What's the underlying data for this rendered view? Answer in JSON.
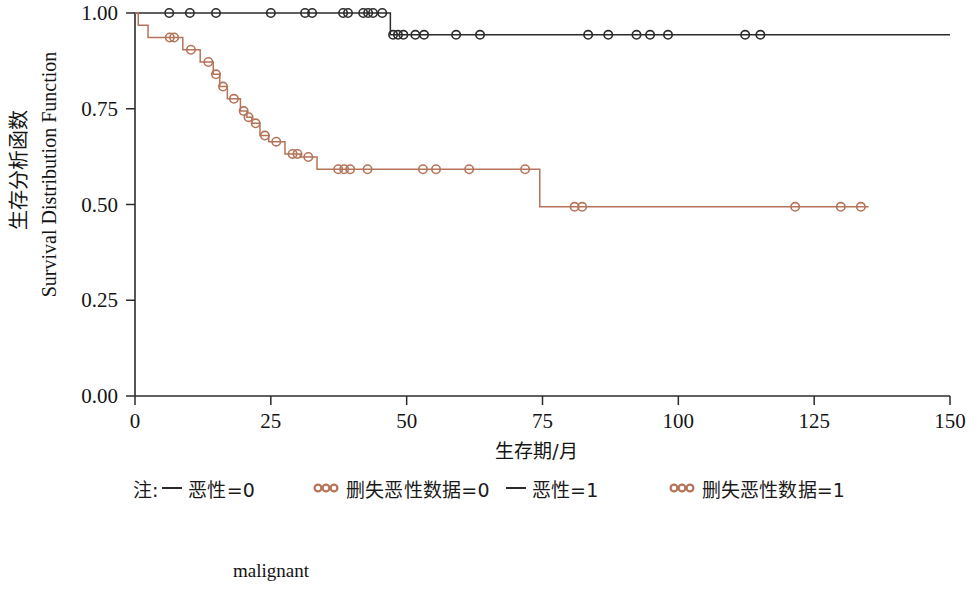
{
  "figure": {
    "caption": "malignant",
    "bottom_caption_name": "malignant"
  },
  "axes": {
    "x": {
      "label": "生存期/月",
      "ticks": [
        0,
        25,
        50,
        75,
        100,
        125,
        150
      ],
      "tick_labels": [
        "0",
        "25",
        "50",
        "75",
        "100",
        "125",
        "150"
      ],
      "range": [
        0,
        150
      ]
    },
    "y": {
      "label_cn": "生存分析函数",
      "label_en": "Survival Distribution Function",
      "ticks": [
        0.0,
        0.25,
        0.5,
        0.75,
        1.0
      ],
      "tick_labels": [
        "0.00",
        "0.25",
        "0.50",
        "0.75",
        "1.00"
      ],
      "range": [
        0,
        1
      ]
    }
  },
  "legend": {
    "note_prefix": "注:",
    "entries": [
      {
        "marker": "line",
        "label": "恶性=0",
        "color": "#2b2b2b"
      },
      {
        "marker": "circles",
        "label": "删失恶性数据=0",
        "color": "#b5745a"
      },
      {
        "marker": "line",
        "label": "恶性=1",
        "color": "#2b2b2b"
      },
      {
        "marker": "circles",
        "label": "删失恶性数据=1",
        "color": "#b5745a"
      }
    ]
  },
  "chart_data": {
    "type": "line",
    "subtype": "kaplan-meier-step",
    "title": "",
    "xlabel": "生存期/月",
    "ylabel": "生存分析函数 / Survival Distribution Function",
    "xlim": [
      0,
      150
    ],
    "ylim": [
      0,
      1
    ],
    "grid": false,
    "legend_position": "below-plot",
    "series": [
      {
        "name": "恶性=0",
        "group": "malignant=0",
        "color": "#2b2b2b",
        "steps": [
          {
            "t": 0,
            "s": 1.0
          },
          {
            "t": 47.0,
            "s": 1.0
          },
          {
            "t": 47.0,
            "s": 0.943
          },
          {
            "t": 150.0,
            "s": 0.943
          }
        ],
        "censored": [
          {
            "t": 6.3,
            "s": 1.0
          },
          {
            "t": 10.1,
            "s": 1.0
          },
          {
            "t": 14.9,
            "s": 1.0
          },
          {
            "t": 25.0,
            "s": 1.0
          },
          {
            "t": 31.3,
            "s": 1.0
          },
          {
            "t": 32.6,
            "s": 1.0
          },
          {
            "t": 38.3,
            "s": 1.0
          },
          {
            "t": 39.2,
            "s": 1.0
          },
          {
            "t": 42.0,
            "s": 1.0
          },
          {
            "t": 42.9,
            "s": 1.0
          },
          {
            "t": 43.8,
            "s": 1.0
          },
          {
            "t": 45.5,
            "s": 1.0
          },
          {
            "t": 47.5,
            "s": 0.943
          },
          {
            "t": 48.4,
            "s": 0.943
          },
          {
            "t": 49.4,
            "s": 0.943
          },
          {
            "t": 51.6,
            "s": 0.943
          },
          {
            "t": 53.2,
            "s": 0.943
          },
          {
            "t": 59.1,
            "s": 0.943
          },
          {
            "t": 63.5,
            "s": 0.943
          },
          {
            "t": 83.4,
            "s": 0.943
          },
          {
            "t": 87.1,
            "s": 0.943
          },
          {
            "t": 92.3,
            "s": 0.943
          },
          {
            "t": 94.8,
            "s": 0.943
          },
          {
            "t": 98.1,
            "s": 0.943
          },
          {
            "t": 112.3,
            "s": 0.943
          },
          {
            "t": 115.1,
            "s": 0.943
          }
        ]
      },
      {
        "name": "恶性=1",
        "group": "malignant=1",
        "color": "#b5745a",
        "steps": [
          {
            "t": 0,
            "s": 1.0
          },
          {
            "t": 0.6,
            "s": 1.0
          },
          {
            "t": 0.6,
            "s": 0.968
          },
          {
            "t": 2.4,
            "s": 0.968
          },
          {
            "t": 2.4,
            "s": 0.936
          },
          {
            "t": 8.8,
            "s": 0.936
          },
          {
            "t": 8.8,
            "s": 0.904
          },
          {
            "t": 12.0,
            "s": 0.904
          },
          {
            "t": 12.0,
            "s": 0.872
          },
          {
            "t": 14.4,
            "s": 0.872
          },
          {
            "t": 14.4,
            "s": 0.84
          },
          {
            "t": 15.6,
            "s": 0.84
          },
          {
            "t": 15.6,
            "s": 0.808
          },
          {
            "t": 17.0,
            "s": 0.808
          },
          {
            "t": 17.0,
            "s": 0.776
          },
          {
            "t": 19.4,
            "s": 0.776
          },
          {
            "t": 19.4,
            "s": 0.744
          },
          {
            "t": 20.6,
            "s": 0.744
          },
          {
            "t": 20.6,
            "s": 0.728
          },
          {
            "t": 21.5,
            "s": 0.728
          },
          {
            "t": 21.5,
            "s": 0.712
          },
          {
            "t": 23.0,
            "s": 0.712
          },
          {
            "t": 23.0,
            "s": 0.68
          },
          {
            "t": 24.6,
            "s": 0.68
          },
          {
            "t": 24.6,
            "s": 0.664
          },
          {
            "t": 27.6,
            "s": 0.664
          },
          {
            "t": 27.6,
            "s": 0.632
          },
          {
            "t": 30.4,
            "s": 0.632
          },
          {
            "t": 30.4,
            "s": 0.624
          },
          {
            "t": 33.5,
            "s": 0.624
          },
          {
            "t": 33.5,
            "s": 0.592
          },
          {
            "t": 74.5,
            "s": 0.592
          },
          {
            "t": 74.5,
            "s": 0.494
          },
          {
            "t": 135.0,
            "s": 0.494
          }
        ],
        "censored": [
          {
            "t": 6.4,
            "s": 0.936
          },
          {
            "t": 7.2,
            "s": 0.936
          },
          {
            "t": 10.3,
            "s": 0.904
          },
          {
            "t": 13.5,
            "s": 0.872
          },
          {
            "t": 14.9,
            "s": 0.84
          },
          {
            "t": 16.2,
            "s": 0.808
          },
          {
            "t": 18.2,
            "s": 0.776
          },
          {
            "t": 20.0,
            "s": 0.744
          },
          {
            "t": 20.9,
            "s": 0.728
          },
          {
            "t": 22.2,
            "s": 0.712
          },
          {
            "t": 23.9,
            "s": 0.68
          },
          {
            "t": 26.0,
            "s": 0.664
          },
          {
            "t": 29.0,
            "s": 0.632
          },
          {
            "t": 29.9,
            "s": 0.632
          },
          {
            "t": 31.9,
            "s": 0.624
          },
          {
            "t": 37.4,
            "s": 0.592
          },
          {
            "t": 38.5,
            "s": 0.592
          },
          {
            "t": 39.6,
            "s": 0.592
          },
          {
            "t": 42.8,
            "s": 0.592
          },
          {
            "t": 53.0,
            "s": 0.592
          },
          {
            "t": 55.4,
            "s": 0.592
          },
          {
            "t": 61.5,
            "s": 0.592
          },
          {
            "t": 71.8,
            "s": 0.592
          },
          {
            "t": 80.9,
            "s": 0.494
          },
          {
            "t": 82.3,
            "s": 0.494
          },
          {
            "t": 121.5,
            "s": 0.494
          },
          {
            "t": 129.9,
            "s": 0.494
          },
          {
            "t": 133.6,
            "s": 0.494
          }
        ]
      }
    ]
  }
}
